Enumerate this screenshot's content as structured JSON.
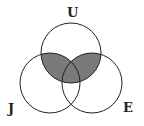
{
  "diagram": {
    "type": "venn",
    "sets": [
      {
        "id": "U",
        "label": "U",
        "cx": 71,
        "cy": 53,
        "r": 30
      },
      {
        "id": "J",
        "label": "J",
        "cx": 50,
        "cy": 83,
        "r": 30
      },
      {
        "id": "E",
        "label": "E",
        "cx": 92,
        "cy": 83,
        "r": 30
      }
    ],
    "shaded_region": "U ∩ (J ∪ E)",
    "colors": {
      "stroke": "#222222",
      "shade": "#7a7a7a",
      "background": "#ffffff"
    }
  }
}
